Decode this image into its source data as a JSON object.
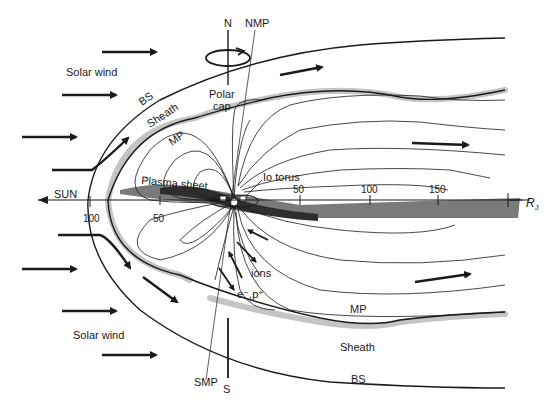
{
  "figure": {
    "labels": {
      "north": "N",
      "nmp": "NMP",
      "south": "S",
      "smp": "SMP",
      "polar_cap": "Polar\ncap",
      "polar_cap_line1": "Polar",
      "polar_cap_line2": "cap",
      "solar_wind_top": "Solar wind",
      "solar_wind_bottom": "Solar wind",
      "bs_top": "BS",
      "bs_bottom": "BS",
      "sheath_top": "Sheath",
      "sheath_bottom": "Sheath",
      "mp_top": "MP",
      "mp_bottom": "MP",
      "plasma_sheet": "Plasma sheet",
      "io_torus": "Io torus",
      "sun": "SUN",
      "ions": "ions",
      "electrons_protons": "e⁻,p⁺",
      "axis_unit": "R",
      "axis_unit_sub": "J"
    },
    "axis_ticks": {
      "sunward": [
        "100",
        "50"
      ],
      "tailward": [
        "50",
        "100",
        "150"
      ]
    },
    "colors": {
      "line": "#1a1a1a",
      "shade": "#c4c4c4",
      "plasma_sheet": "#3a3a3a",
      "tail_sheet": "#7a7a7a",
      "background": "#ffffff"
    }
  }
}
